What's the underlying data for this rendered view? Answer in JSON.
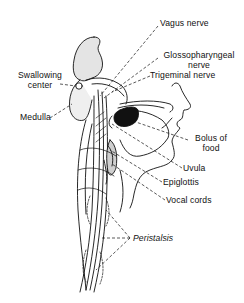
{
  "diagram": {
    "colors": {
      "ink": "#111111",
      "shade": "#d8d8d8",
      "bolus_fill": "#111111",
      "background": "#ffffff"
    },
    "labels": {
      "vagus_nerve": "Vagus nerve",
      "glossopharyngeal_line1": "Glossopharyngeal",
      "glossopharyngeal_line2": "nerve",
      "trigeminal_nerve": "Trigeminal nerve",
      "swallowing_center_line1": "Swallowing",
      "swallowing_center_line2": "center",
      "medulla": "Medulla",
      "bolus_line1": "Bolus of",
      "bolus_line2": "food",
      "uvula": "Uvula",
      "epiglottis": "Epiglottis",
      "vocal_cords": "Vocal cords",
      "peristalsis": "Peristalsis"
    }
  }
}
